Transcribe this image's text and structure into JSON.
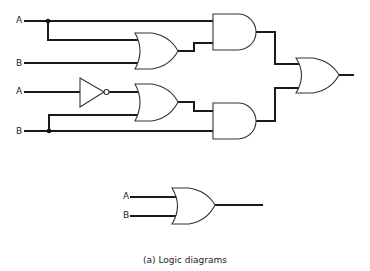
{
  "diagram": {
    "caption": "(a) Logic diagrams",
    "circuit_1": {
      "inputs": [
        {
          "label": "A",
          "role": "top-input-a"
        },
        {
          "label": "B",
          "role": "top-input-b"
        },
        {
          "label": "A",
          "role": "inverted-input-a"
        },
        {
          "label": "B",
          "role": "bottom-input-b"
        }
      ],
      "gates": [
        "OR",
        "NOT",
        "OR",
        "AND",
        "AND",
        "OR"
      ]
    },
    "circuit_2": {
      "inputs": [
        {
          "label": "A"
        },
        {
          "label": "B"
        }
      ],
      "gates": [
        "OR"
      ]
    }
  }
}
